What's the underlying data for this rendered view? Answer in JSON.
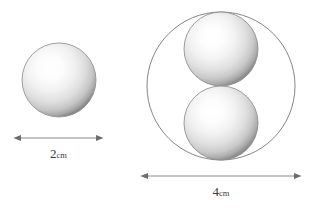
{
  "figure": {
    "type": "geometry-diagram",
    "background_color": "#ffffff"
  },
  "colors": {
    "outline": "#6b6b6b",
    "sphere_edge": "#8f8f8f",
    "sphere_core": "#ffffff",
    "sphere_mid": "#e2e2e2",
    "dimension_line": "#8a8a8a",
    "label_text": "#3c3c3c"
  },
  "left_figure": {
    "name": "single-sphere",
    "sphere": {
      "cx": 59,
      "cy": 80,
      "r": 37,
      "diameter_px": 74
    },
    "dimension": {
      "x1": 20,
      "x2": 97,
      "y": 138,
      "value": "2",
      "unit": "cm",
      "full_label": "2cm"
    }
  },
  "right_figure": {
    "name": "two-spheres-in-circle",
    "outer_circle": {
      "cx": 221,
      "cy": 86,
      "r": 74,
      "diameter_px": 148
    },
    "spheres": [
      {
        "name": "upper-sphere",
        "cx": 221,
        "cy": 49,
        "r": 37,
        "diameter_px": 74
      },
      {
        "name": "lower-sphere",
        "cx": 221,
        "cy": 123,
        "r": 37,
        "diameter_px": 74
      }
    ],
    "dimension": {
      "x1": 147,
      "x2": 295,
      "y": 176,
      "value": "4",
      "unit": "cm",
      "full_label": "4cm"
    }
  },
  "labels": {
    "left_number": "2",
    "left_unit": "cm",
    "right_number": "4",
    "right_unit": "cm"
  }
}
